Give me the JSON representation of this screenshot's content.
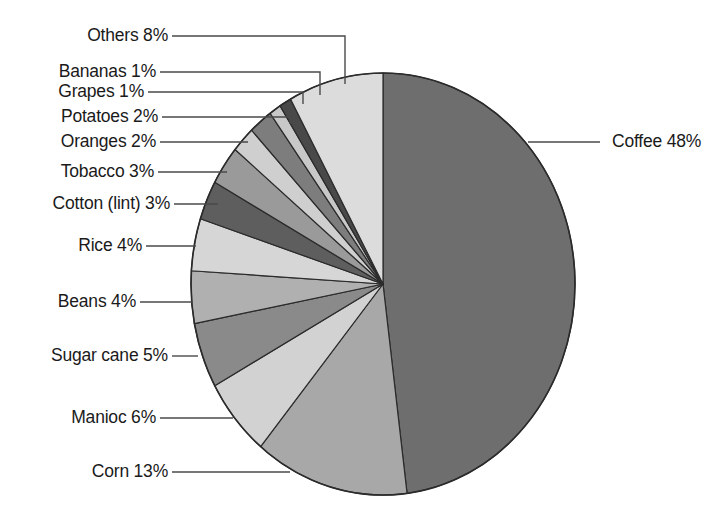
{
  "chart_data": {
    "type": "pie",
    "title": "",
    "subtitle": "",
    "xlabel": "",
    "ylabel": "",
    "legend_position": "none",
    "grid": false,
    "units": "percent",
    "start_angle_deg": 0,
    "direction": "clockwise",
    "categories": [
      "Coffee",
      "Corn",
      "Manioc",
      "Sugar cane",
      "Beans",
      "Rice",
      "Cotton (lint)",
      "Tobacco",
      "Oranges",
      "Potatoes",
      "Grapes",
      "Bananas",
      "Others"
    ],
    "values": [
      48,
      13,
      6,
      5,
      4,
      4,
      3,
      3,
      2,
      2,
      1,
      1,
      8
    ],
    "slices": [
      {
        "name": "Coffee",
        "value": 48,
        "label": "Coffee 48%",
        "color": "#6e6e6e",
        "label_side": "right"
      },
      {
        "name": "Corn",
        "value": 13,
        "label": "Corn 13%",
        "color": "#a8a8a8",
        "label_side": "left"
      },
      {
        "name": "Manioc",
        "value": 6,
        "label": "Manioc 6%",
        "color": "#d2d2d2",
        "label_side": "left"
      },
      {
        "name": "Sugar cane",
        "value": 5,
        "label": "Sugar cane 5%",
        "color": "#8a8a8a",
        "label_side": "left"
      },
      {
        "name": "Beans",
        "value": 4,
        "label": "Beans 4%",
        "color": "#b0b0b0",
        "label_side": "left"
      },
      {
        "name": "Rice",
        "value": 4,
        "label": "Rice 4%",
        "color": "#d6d6d6",
        "label_side": "left"
      },
      {
        "name": "Cotton (lint)",
        "value": 3,
        "label": "Cotton (lint) 3%",
        "color": "#5e5e5e",
        "label_side": "left"
      },
      {
        "name": "Tobacco",
        "value": 3,
        "label": "Tobacco 3%",
        "color": "#9a9a9a",
        "label_side": "left"
      },
      {
        "name": "Oranges",
        "value": 2,
        "label": "Oranges 2%",
        "color": "#cfcfcf",
        "label_side": "left"
      },
      {
        "name": "Potatoes",
        "value": 2,
        "label": "Potatoes 2%",
        "color": "#7d7d7d",
        "label_side": "left"
      },
      {
        "name": "Grapes",
        "value": 1,
        "label": "Grapes 1%",
        "color": "#c8c8c8",
        "label_side": "left"
      },
      {
        "name": "Bananas",
        "value": 1,
        "label": "Bananas 1%",
        "color": "#494949",
        "label_side": "left"
      },
      {
        "name": "Others",
        "value": 8,
        "label": "Others 8%",
        "color": "#dcdcdc",
        "label_side": "left"
      }
    ]
  },
  "labels": {
    "others": "Others 8%",
    "bananas": "Bananas 1%",
    "grapes": "Grapes 1%",
    "potatoes": "Potatoes 2%",
    "oranges": "Oranges 2%",
    "tobacco": "Tobacco 3%",
    "cotton": "Cotton (lint) 3%",
    "rice": "Rice 4%",
    "beans": "Beans 4%",
    "sugar_cane": "Sugar cane 5%",
    "manioc": "Manioc 6%",
    "corn": "Corn 13%",
    "coffee": "Coffee 48%"
  },
  "style": {
    "background": "#ffffff",
    "text_color": "#1a1a1a",
    "leader_line_color": "#4a4a4a",
    "slice_outline": "#2b2b2b"
  }
}
